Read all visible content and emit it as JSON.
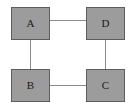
{
  "figure": {
    "kind": "graph-diagram",
    "width_px": 136,
    "height_px": 111,
    "background_color": "#ffffff",
    "node_fill_color": "#9c9c9c",
    "node_border_color": "#5d5d5d",
    "edge_color": "#8c8c8c"
  },
  "nodes": [
    {
      "id": "A",
      "label": "A",
      "x": 11,
      "y": 7,
      "w": 39,
      "h": 33
    },
    {
      "id": "D",
      "label": "D",
      "x": 86,
      "y": 7,
      "w": 39,
      "h": 33
    },
    {
      "id": "B",
      "label": "B",
      "x": 11,
      "y": 69,
      "w": 39,
      "h": 33
    },
    {
      "id": "C",
      "label": "C",
      "x": 86,
      "y": 69,
      "w": 39,
      "h": 33
    }
  ],
  "edges": [
    {
      "id": "A-D",
      "from": "A",
      "to": "D",
      "orientation": "horizontal",
      "x": 50,
      "y": 20,
      "length": 36
    },
    {
      "id": "A-B",
      "from": "A",
      "to": "B",
      "orientation": "vertical",
      "x": 30,
      "y": 40,
      "length": 29
    },
    {
      "id": "B-C",
      "from": "B",
      "to": "C",
      "orientation": "horizontal",
      "x": 50,
      "y": 85,
      "length": 36
    },
    {
      "id": "C-D",
      "from": "D",
      "to": "C",
      "orientation": "vertical",
      "x": 105,
      "y": 40,
      "length": 29
    }
  ]
}
